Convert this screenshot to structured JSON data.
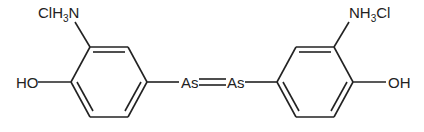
{
  "diagram": {
    "type": "chemical-structure",
    "labels": {
      "left_amine_prefix": "ClH",
      "left_amine_sub": "3",
      "left_amine_suffix": "N",
      "left_hydroxyl": "HO",
      "arsenic_left": "As",
      "arsenic_right": "As",
      "right_amine_prefix": "NH",
      "right_amine_sub": "3",
      "right_amine_suffix": "Cl",
      "right_hydroxyl": "OH"
    },
    "bond_color": "#222222",
    "text_color": "#222222"
  }
}
